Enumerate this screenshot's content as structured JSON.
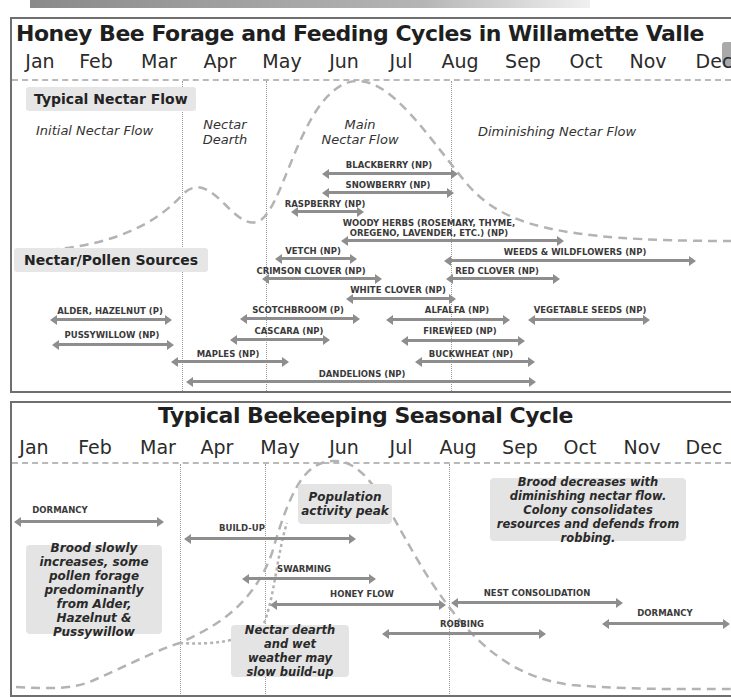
{
  "forage_chart": {
    "title": "Honey Bee Forage and Feeding Cycles in Willamette Valle",
    "months": [
      "Jan",
      "Feb",
      "Mar",
      "Apr",
      "May",
      "Jun",
      "Jul",
      "Aug",
      "Sep",
      "Oct",
      "Nov",
      "Dec"
    ],
    "section_nectar_flow": "Typical Nectar Flow",
    "section_sources": "Nectar/Pollen Sources",
    "phases": {
      "initial": "Initial Nectar Flow",
      "dearth_line1": "Nectar",
      "dearth_line2": "Dearth",
      "main_line1": "Main",
      "main_line2": "Nectar Flow",
      "diminishing": "Diminishing Nectar Flow"
    },
    "sources": [
      {
        "label": "BLACKBERRY (NP)",
        "line2": ""
      },
      {
        "label": "SNOWBERRY (NP)",
        "line2": ""
      },
      {
        "label": "RASPBERRY (NP)",
        "line2": ""
      },
      {
        "label": "WOODY HERBS (ROSEMARY, THYME,",
        "line2": "OREGENO, LAVENDER, ETC.) (NP)"
      },
      {
        "label": "VETCH (NP)",
        "line2": ""
      },
      {
        "label": "WEEDS & WILDFLOWERS (NP)",
        "line2": ""
      },
      {
        "label": "CRIMSON CLOVER (NP)",
        "line2": ""
      },
      {
        "label": "RED CLOVER (NP)",
        "line2": ""
      },
      {
        "label": "WHITE CLOVER (NP)",
        "line2": ""
      },
      {
        "label": "ALDER, HAZELNUT (P)",
        "line2": ""
      },
      {
        "label": "SCOTCHBROOM (P)",
        "line2": ""
      },
      {
        "label": "ALFALFA (NP)",
        "line2": ""
      },
      {
        "label": "VEGETABLE SEEDS (NP)",
        "line2": ""
      },
      {
        "label": "PUSSYWILLOW (NP)",
        "line2": ""
      },
      {
        "label": "CASCARA (NP)",
        "line2": ""
      },
      {
        "label": "FIREWEED (NP)",
        "line2": ""
      },
      {
        "label": "MAPLES (NP)",
        "line2": ""
      },
      {
        "label": "BUCKWHEAT (NP)",
        "line2": ""
      },
      {
        "label": "DANDELIONS (NP)",
        "line2": ""
      }
    ]
  },
  "beekeeping_chart": {
    "title": "Typical Beekeeping Seasonal Cycle",
    "months": [
      "Jan",
      "Feb",
      "Mar",
      "Apr",
      "May",
      "Jun",
      "Jul",
      "Aug",
      "Sep",
      "Oct",
      "Nov",
      "Dec"
    ],
    "activities": [
      {
        "label": "DORMANCY"
      },
      {
        "label": "BUILD-UP"
      },
      {
        "label": "SWARMING"
      },
      {
        "label": "HONEY FLOW"
      },
      {
        "label": "NEST CONSOLIDATION"
      },
      {
        "label": "DORMANCY"
      },
      {
        "label": "ROBBING"
      }
    ],
    "notes": {
      "population_peak": "Population activity peak",
      "brood_decrease": "Brood decreases with diminishing nectar flow. Colony consolidates resources and defends from robbing.",
      "brood_increase": "Brood slowly increases, some pollen forage predominantly from Alder, Hazelnut & Pussywillow",
      "dearth_weather": "Nectar dearth and wet weather may slow build-up"
    }
  }
}
